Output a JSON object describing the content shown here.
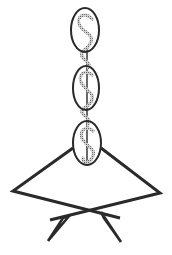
{
  "figure": {
    "colors": {
      "background": "#ffffff",
      "stroke": "#2a2a2a",
      "dollar_fill": "#b8b8b8",
      "dollar_outline": "#555555"
    },
    "ovals": [
      {
        "label": "oval-top",
        "cx": 85,
        "cy": 30,
        "rx": 14,
        "ry": 22,
        "symbol": "$"
      },
      {
        "label": "oval-middle",
        "cx": 86,
        "cy": 88,
        "rx": 13,
        "ry": 22,
        "symbol": "$"
      },
      {
        "label": "oval-bottom",
        "cx": 87,
        "cy": 143,
        "rx": 14,
        "ry": 22,
        "symbol": "$"
      }
    ]
  }
}
